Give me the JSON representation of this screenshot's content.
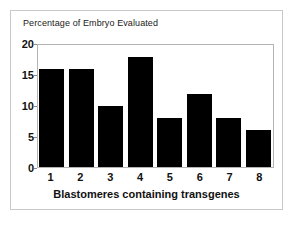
{
  "chart_data": {
    "type": "bar",
    "title": "Percentage of Embryo Evaluated",
    "xlabel": "Blastomeres containing transgenes",
    "ylabel": "",
    "categories": [
      "1",
      "2",
      "3",
      "4",
      "5",
      "6",
      "7",
      "8"
    ],
    "values": [
      16,
      16,
      10,
      18,
      8,
      12,
      8,
      6
    ],
    "ylim": [
      0,
      20
    ],
    "yticks": [
      "0",
      "5",
      "10",
      "15",
      "20"
    ],
    "ytick_values": [
      0,
      5,
      10,
      15,
      20
    ],
    "grid": false,
    "legend": false,
    "bar_color": "#000000",
    "frame_color": "#b4b4b4",
    "border_color": "#c8c8c8",
    "background": "#ffffff"
  }
}
